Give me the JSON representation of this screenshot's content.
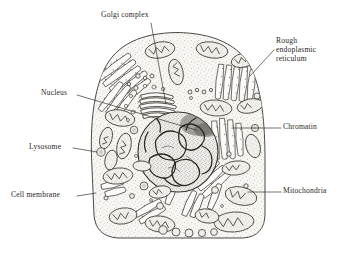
{
  "figure": {
    "kind": "biological-illustration",
    "background_color": "#ffffff",
    "ink_color": "#2a2724",
    "cytoplasm_color": "#f6f5f2"
  },
  "labels": {
    "golgi": "Golgi complex",
    "rer_line1": "Rough",
    "rer_line2": "endoplasmic",
    "rer_line3": "reticulum",
    "nucleus": "Nucleus",
    "chromatin": "Chromatin",
    "lysosome": "Lysosome",
    "cell_membrane": "Cell membrane",
    "mitochondria": "Mitochondria"
  },
  "structures": [
    {
      "name": "cell-membrane",
      "label": "Cell membrane",
      "side": "left"
    },
    {
      "name": "nucleus",
      "label": "Nucleus",
      "side": "left"
    },
    {
      "name": "lysosome",
      "label": "Lysosome",
      "side": "left"
    },
    {
      "name": "golgi-complex",
      "label": "Golgi complex",
      "side": "top"
    },
    {
      "name": "rough-endoplasmic-reticulum",
      "label": "Rough endoplasmic reticulum",
      "side": "right"
    },
    {
      "name": "chromatin",
      "label": "Chromatin",
      "side": "right"
    },
    {
      "name": "mitochondria",
      "label": "Mitochondria",
      "side": "right"
    }
  ]
}
